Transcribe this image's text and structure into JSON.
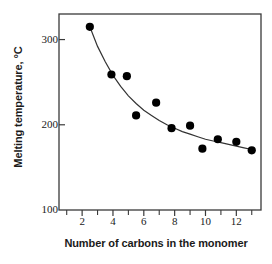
{
  "chart_data": {
    "type": "scatter",
    "title": "",
    "xlabel": "Number of carbons in the monomer",
    "ylabel": "Melting temperature, °C",
    "xlim": [
      0.5,
      13.6
    ],
    "ylim": [
      100,
      330
    ],
    "grid": false,
    "legend": "none",
    "x_ticks_major": [
      2,
      4,
      6,
      8,
      10,
      12
    ],
    "x_ticks_minor": [
      1,
      3,
      5,
      7,
      9,
      11,
      13
    ],
    "x_tick_labels": [
      "2",
      "4",
      "6",
      "8",
      "10",
      "12"
    ],
    "y_ticks": [
      100,
      200,
      300
    ],
    "y_tick_labels": [
      "100",
      "200",
      "300"
    ],
    "marker": "filled-circle",
    "marker_color": "#000000",
    "fit_curve": "decaying exponential trend line",
    "fit_curve_color": "#333333",
    "points": [
      {
        "x": 2.5,
        "y": 315
      },
      {
        "x": 3.9,
        "y": 259
      },
      {
        "x": 4.9,
        "y": 257
      },
      {
        "x": 5.5,
        "y": 211
      },
      {
        "x": 6.8,
        "y": 226
      },
      {
        "x": 7.8,
        "y": 196
      },
      {
        "x": 9.0,
        "y": 199
      },
      {
        "x": 9.8,
        "y": 172
      },
      {
        "x": 10.8,
        "y": 183
      },
      {
        "x": 12.0,
        "y": 180
      },
      {
        "x": 13.0,
        "y": 170
      }
    ],
    "fit_points": [
      {
        "x": 2.5,
        "y": 315
      },
      {
        "x": 3.0,
        "y": 292
      },
      {
        "x": 3.5,
        "y": 274
      },
      {
        "x": 4.0,
        "y": 258
      },
      {
        "x": 4.5,
        "y": 245
      },
      {
        "x": 5.0,
        "y": 234
      },
      {
        "x": 5.5,
        "y": 225
      },
      {
        "x": 6.0,
        "y": 217
      },
      {
        "x": 6.5,
        "y": 211
      },
      {
        "x": 7.0,
        "y": 205
      },
      {
        "x": 7.5,
        "y": 200
      },
      {
        "x": 8.0,
        "y": 196
      },
      {
        "x": 8.5,
        "y": 192
      },
      {
        "x": 9.0,
        "y": 189
      },
      {
        "x": 9.5,
        "y": 186
      },
      {
        "x": 10.0,
        "y": 183
      },
      {
        "x": 10.5,
        "y": 181
      },
      {
        "x": 11.0,
        "y": 179
      },
      {
        "x": 11.5,
        "y": 177
      },
      {
        "x": 12.0,
        "y": 175
      },
      {
        "x": 12.5,
        "y": 173
      },
      {
        "x": 13.0,
        "y": 171
      }
    ]
  },
  "axes": {
    "frame_color": "#3a3a3a",
    "background": "#ffffff"
  }
}
